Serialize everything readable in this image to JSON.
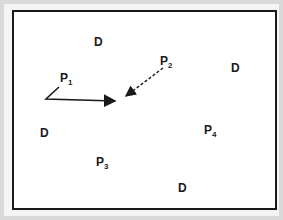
{
  "diagram": {
    "labels": [
      {
        "id": "d1",
        "text": "D",
        "x": 94,
        "y": 36
      },
      {
        "id": "d2",
        "text": "D",
        "x": 231,
        "y": 62
      },
      {
        "id": "d3",
        "text": "D",
        "x": 40,
        "y": 127
      },
      {
        "id": "d4",
        "text": "D",
        "x": 178,
        "y": 182
      }
    ],
    "points": [
      {
        "id": "p1",
        "base": "P",
        "sub": "1",
        "x": 60,
        "y": 71
      },
      {
        "id": "p2",
        "base": "P",
        "sub": "2",
        "x": 160,
        "y": 55
      },
      {
        "id": "p3",
        "base": "P",
        "sub": "3",
        "x": 96,
        "y": 156
      },
      {
        "id": "p4",
        "base": "P",
        "sub": "4",
        "x": 204,
        "y": 124
      }
    ],
    "arrows": [
      {
        "id": "arrow-solid",
        "style": "solid",
        "path": "P1 to center",
        "color": "#1a1a1a"
      },
      {
        "id": "arrow-dashed",
        "style": "dashed",
        "path": "P2 to center",
        "color": "#1a1a1a"
      }
    ],
    "colors": {
      "outer_background": "#d9d9d9",
      "frame_border": "#1a1a1a",
      "canvas": "#ffffff"
    }
  }
}
